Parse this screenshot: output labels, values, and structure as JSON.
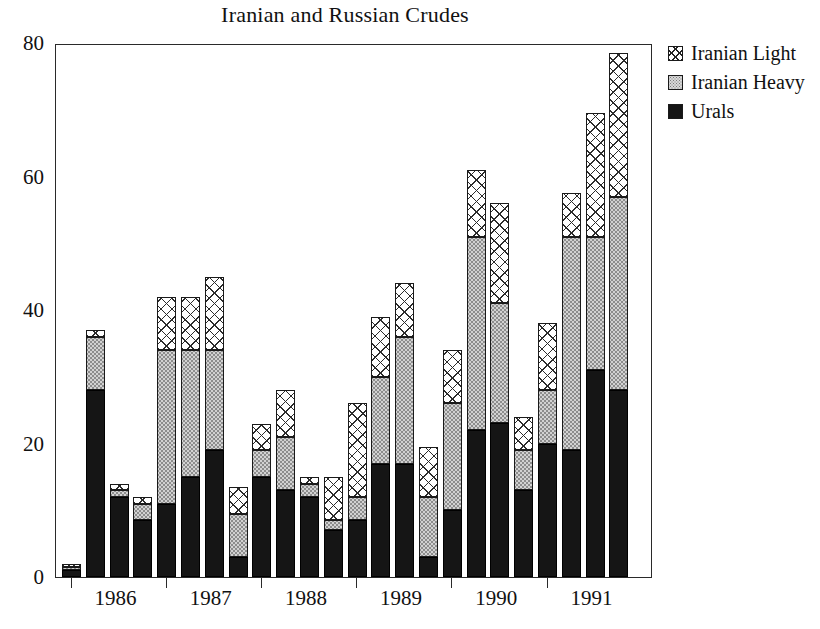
{
  "chart_data": {
    "type": "bar",
    "subtype": "stacked-bar",
    "title": "Iranian and Russian Crudes",
    "xlabel": "",
    "ylabel": "",
    "ylim": [
      0,
      80
    ],
    "yticks": [
      0,
      20,
      40,
      60,
      80
    ],
    "ytick_labels": [
      "0",
      "20",
      "40",
      "60",
      "80"
    ],
    "grid": false,
    "legend_position": "right-top",
    "legend": [
      "Iranian Light",
      "Iranian Heavy",
      "Urals"
    ],
    "stack_order_bottom_to_top": [
      "Urals",
      "Iranian Heavy",
      "Iranian Light"
    ],
    "group_labels": [
      "1986",
      "1987",
      "1988",
      "1989",
      "1990",
      "1991"
    ],
    "bars_per_group": 4,
    "categories": [
      "1986 Q1",
      "1986 Q2",
      "1986 Q3",
      "1986 Q4",
      "1987 Q1",
      "1987 Q2",
      "1987 Q3",
      "1987 Q4",
      "1988 Q1",
      "1988 Q2",
      "1988 Q3",
      "1988 Q4",
      "1989 Q1",
      "1989 Q2",
      "1989 Q3",
      "1989 Q4",
      "1990 Q1",
      "1990 Q2",
      "1990 Q3",
      "1990 Q4",
      "1991 Q1",
      "1991 Q2",
      "1991 Q3",
      "1991 Q4"
    ],
    "series": [
      {
        "name": "Urals",
        "pattern": "solid-black",
        "values": [
          1,
          28,
          12,
          8.5,
          11,
          15,
          19,
          3,
          15,
          13,
          12,
          7,
          8.5,
          17,
          17,
          3,
          10,
          22,
          23,
          13,
          20,
          19,
          31,
          28
        ]
      },
      {
        "name": "Iranian Heavy",
        "pattern": "stipple-grey",
        "values": [
          0.5,
          8,
          1,
          2.5,
          23,
          19,
          15,
          6.5,
          4,
          8,
          2,
          1.5,
          3.5,
          13,
          19,
          9,
          16,
          29,
          18,
          6,
          8,
          32,
          20,
          29
        ]
      },
      {
        "name": "Iranian Light",
        "pattern": "crosshatch",
        "values": [
          0.5,
          1,
          1,
          1,
          8,
          8,
          11,
          4,
          4,
          7,
          1,
          6.5,
          14,
          9,
          8,
          7.5,
          8,
          10,
          15,
          5,
          10,
          6.5,
          18.5,
          21.5
        ]
      }
    ],
    "totals": [
      2,
      37,
      14,
      12,
      42,
      42,
      45,
      14,
      23,
      28,
      15,
      15,
      26,
      39,
      44,
      19.5,
      34,
      61,
      56,
      24,
      38,
      57.5,
      69.5,
      78.5
    ]
  },
  "legend": {
    "rows": [
      {
        "label": "Iranian Light",
        "swatch": "crosshatch-swatch"
      },
      {
        "label": "Iranian Heavy",
        "swatch": "stipple-swatch"
      },
      {
        "label": "Urals",
        "swatch": "solid-black-swatch"
      }
    ]
  },
  "colors": {
    "axis": "#2a2a2a",
    "urals": "#151515",
    "iranian_heavy": "#d2d2d2",
    "iranian_light": "#ffffff",
    "background": "#ffffff"
  }
}
